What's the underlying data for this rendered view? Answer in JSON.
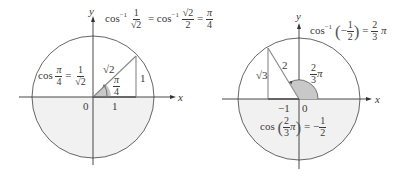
{
  "colors": {
    "circle": "#555555",
    "axis": "#333333",
    "lower_half_fill": "#f1f1f1",
    "triangle": "#888888",
    "angle_fill": "#c8c8c8"
  },
  "left_panel": {
    "axis_x_label": "x",
    "axis_y_label": "y",
    "origin_label": "0",
    "tick_label": "1",
    "hypotenuse_label": "√2",
    "opposite_label": "1",
    "angle_label": {
      "num": "π",
      "den": "4"
    },
    "title_equation": {
      "lhs_func": "cos",
      "inv": "−1",
      "frac1": {
        "num": "1",
        "den": "√2"
      },
      "eq": "=",
      "rhs_func": "cos",
      "frac2": {
        "num": "√2",
        "den": "2"
      },
      "eq2": "=",
      "result": {
        "num": "π",
        "den": "4"
      }
    },
    "cos_equation": {
      "func": "cos",
      "arg": {
        "num": "π",
        "den": "4"
      },
      "eq": "=",
      "value": {
        "num": "1",
        "den": "√2"
      }
    }
  },
  "right_panel": {
    "axis_x_label": "x",
    "axis_y_label": "y",
    "origin_label": "0",
    "tick_label": "−1",
    "hypotenuse_label": "2",
    "opposite_label": "√3",
    "angle_label": {
      "num": "2",
      "den": "3",
      "suffix": "π"
    },
    "title_equation": {
      "func": "cos",
      "inv": "−1",
      "open": "(",
      "neg": "−",
      "arg": {
        "num": "1",
        "den": "2"
      },
      "close": ")",
      "eq": "=",
      "result": {
        "num": "2",
        "den": "3"
      },
      "suffix": "π"
    },
    "cos_equation": {
      "func": "cos",
      "open": "(",
      "arg": {
        "num": "2",
        "den": "3"
      },
      "arg_suffix": "π",
      "close": ")",
      "eq": "=",
      "neg": "−",
      "value": {
        "num": "1",
        "den": "2"
      }
    }
  }
}
